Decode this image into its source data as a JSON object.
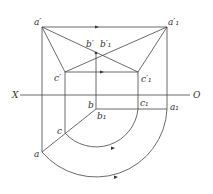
{
  "labels": {
    "a_prime": "a′",
    "a1_prime": "a′₁",
    "b_prime": "b′",
    "b1_prime": "b′₁",
    "c_prime": "c′",
    "c1_prime": "c′₁",
    "X": "X",
    "O": "O",
    "b": "b",
    "b1": "b₁",
    "c1": "c₁",
    "a1": "a₁",
    "c": "c",
    "a": "a"
  },
  "colors": {
    "line": "#444444",
    "text": "#333333",
    "background": "#ffffff"
  }
}
